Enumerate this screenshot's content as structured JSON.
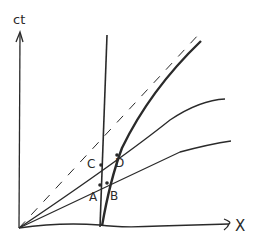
{
  "diagram": {
    "type": "spacetime-diagram",
    "axes": {
      "y_label": "ct",
      "x_label": "X"
    },
    "points": {
      "A": "A",
      "B": "B",
      "C": "C",
      "D": "D"
    },
    "lines": [
      {
        "name": "light-line",
        "style": "dashed"
      },
      {
        "name": "vertical-worldline",
        "style": "solid"
      },
      {
        "name": "moving-worldline",
        "style": "thick-solid"
      },
      {
        "name": "upper-simultaneity-line",
        "style": "solid"
      },
      {
        "name": "lower-simultaneity-line",
        "style": "solid"
      }
    ],
    "colors": {
      "ink": "#2a2a2a",
      "background": "#ffffff"
    }
  }
}
